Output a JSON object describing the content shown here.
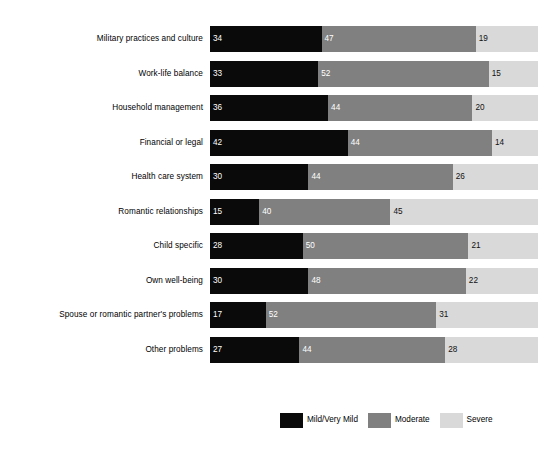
{
  "chart_data": {
    "type": "bar",
    "orientation": "horizontal",
    "stacked": true,
    "normalized_percent": true,
    "title": "",
    "subtitle": "",
    "xlabel": "",
    "ylabel": "",
    "xlim": [
      0,
      100
    ],
    "grid": false,
    "legend_position": "bottom-center",
    "categories": [
      "Military practices and culture",
      "Work-life balance",
      "Household management",
      "Financial or legal",
      "Health care system",
      "Romantic relationships",
      "Child specific",
      "Own well-being",
      "Spouse or romantic partner's problems",
      "Other problems"
    ],
    "series": [
      {
        "name": "Mild/Very Mild",
        "color": "#0a0a0a",
        "values": [
          34,
          33,
          36,
          42,
          30,
          15,
          28,
          30,
          17,
          27
        ]
      },
      {
        "name": "Moderate",
        "color": "#808080",
        "values": [
          47,
          52,
          44,
          44,
          44,
          40,
          50,
          48,
          52,
          44
        ]
      },
      {
        "name": "Severe",
        "color": "#d9d9d9",
        "values": [
          19,
          15,
          20,
          14,
          26,
          45,
          21,
          22,
          31,
          28
        ]
      }
    ],
    "legend": [
      {
        "label": "Mild/Very Mild",
        "color": "#0a0a0a"
      },
      {
        "label": "Moderate",
        "color": "#808080"
      },
      {
        "label": "Severe",
        "color": "#d9d9d9"
      }
    ]
  }
}
